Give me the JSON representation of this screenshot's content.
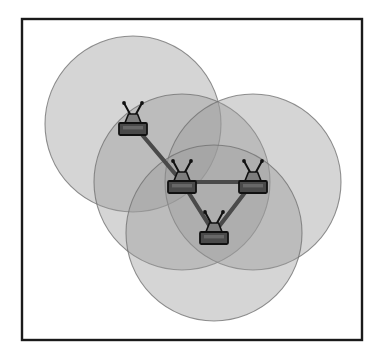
{
  "figure": {
    "canvas": {
      "width": 384,
      "height": 356,
      "background": "#ffffff"
    }
  },
  "frame": {
    "name": "figure-border",
    "x": 22,
    "y": 19,
    "width": 340,
    "height": 321,
    "stroke": "#1a1a1a",
    "stroke_width": 2.4,
    "fill": "#ffffff"
  },
  "coverage": {
    "radius": 88,
    "fill": "#9a9a9a",
    "fill_opacity": 0.42,
    "stroke": "#6e6e6e",
    "stroke_opacity": 0.75,
    "stroke_width": 1.1,
    "circles": [
      {
        "id": "coverage-node-1",
        "label": "Coverage area node 1",
        "cx": 133,
        "cy": 124,
        "r": 88
      },
      {
        "id": "coverage-node-2",
        "label": "Coverage area node 2",
        "cx": 182,
        "cy": 182,
        "r": 88
      },
      {
        "id": "coverage-node-3",
        "label": "Coverage area node 3",
        "cx": 253,
        "cy": 182,
        "r": 88
      },
      {
        "id": "coverage-node-4",
        "label": "Coverage area node 4",
        "cx": 214,
        "cy": 233,
        "r": 88
      }
    ]
  },
  "links": {
    "stroke": "#4a4a4a",
    "stroke_width": 4.2,
    "edges": [
      {
        "id": "link-1-2",
        "label": "Link node 1 to node 2",
        "x1": 133,
        "y1": 124,
        "x2": 182,
        "y2": 182
      },
      {
        "id": "link-2-3",
        "label": "Link node 2 to node 3",
        "x1": 182,
        "y1": 182,
        "x2": 253,
        "y2": 182
      },
      {
        "id": "link-2-4",
        "label": "Link node 2 to node 4",
        "x1": 182,
        "y1": 182,
        "x2": 214,
        "y2": 233
      },
      {
        "id": "link-3-4",
        "label": "Link node 3 to node 4",
        "x1": 253,
        "y1": 182,
        "x2": 214,
        "y2": 233
      }
    ]
  },
  "nodes": [
    {
      "id": "node-1",
      "label": "Wireless router 1",
      "cx": 133,
      "cy": 124,
      "icon": "wireless-router-icon"
    },
    {
      "id": "node-2",
      "label": "Wireless router 2",
      "cx": 182,
      "cy": 182,
      "icon": "wireless-router-icon"
    },
    {
      "id": "node-3",
      "label": "Wireless router 3",
      "cx": 253,
      "cy": 182,
      "icon": "wireless-router-icon"
    },
    {
      "id": "node-4",
      "label": "Wireless router 4",
      "cx": 214,
      "cy": 233,
      "icon": "wireless-router-icon"
    }
  ],
  "node_icon": {
    "name": "wireless-router-icon",
    "body_fill": "#4a4a4a",
    "body_stroke": "#111111",
    "dome_fill": "#7d7d7d",
    "dome_stroke": "#111111",
    "antenna_stroke": "#111111",
    "antenna_tip_fill": "#111111",
    "body_width": 28,
    "body_height": 12,
    "dome_width": 17,
    "dome_height": 10
  },
  "colors": {
    "page_background": "#ffffff",
    "border": "#1a1a1a",
    "coverage_fill": "#9a9a9a",
    "coverage_stroke": "#6e6e6e",
    "link": "#4a4a4a",
    "node_body": "#4a4a4a",
    "node_dome": "#7d7d7d",
    "node_outline": "#111111"
  }
}
